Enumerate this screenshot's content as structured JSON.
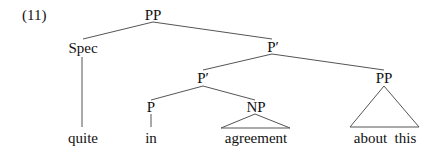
{
  "example_number": "(11)",
  "tree": {
    "nodes": {
      "root": "PP",
      "spec": "Spec",
      "pbar_upper": "P′",
      "pbar_inner": "P′",
      "pp_right": "PP",
      "p": "P",
      "np": "NP"
    },
    "leaves": {
      "quite": "quite",
      "in": "in",
      "agreement": "agreement",
      "about_this": "about  this"
    }
  }
}
